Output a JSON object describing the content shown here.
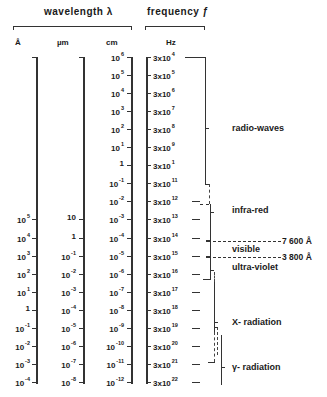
{
  "headers": {
    "wavelength": "wavelength λ",
    "frequency": "frequency ƒ"
  },
  "units": {
    "angstrom": "Å",
    "micrometer": "µm",
    "centimeter": "cm",
    "hertz": "Hz"
  },
  "rows": [
    {
      "ang": "",
      "um": "",
      "cm": [
        "10",
        "6"
      ],
      "hz": [
        "3x10",
        "4"
      ]
    },
    {
      "ang": "",
      "um": "",
      "cm": [
        "10",
        "5"
      ],
      "hz": [
        "3x10",
        "5"
      ]
    },
    {
      "ang": "",
      "um": "",
      "cm": [
        "10",
        "4"
      ],
      "hz": [
        "3x10",
        "6"
      ]
    },
    {
      "ang": "",
      "um": "",
      "cm": [
        "10",
        "3"
      ],
      "hz": [
        "3x10",
        "7"
      ]
    },
    {
      "ang": "",
      "um": "",
      "cm": [
        "10",
        "2"
      ],
      "hz": [
        "3x10",
        "8"
      ]
    },
    {
      "ang": "",
      "um": "",
      "cm": [
        "10",
        "1"
      ],
      "hz": [
        "3x10",
        "9"
      ]
    },
    {
      "ang": "",
      "um": "",
      "cm": [
        "1",
        ""
      ],
      "hz": [
        "3x10",
        "1"
      ]
    },
    {
      "ang": "",
      "um": "",
      "cm": [
        "10",
        "-1"
      ],
      "hz": [
        "3x10",
        "11"
      ]
    },
    {
      "ang": "",
      "um": "",
      "cm": [
        "10",
        "-2"
      ],
      "hz": [
        "3x10",
        "12"
      ]
    },
    {
      "ang": [
        "10",
        "5"
      ],
      "um": [
        "10",
        ""
      ],
      "cm": [
        "10",
        "-3"
      ],
      "hz": [
        "3x10",
        "13"
      ]
    },
    {
      "ang": [
        "10",
        "4"
      ],
      "um": [
        "1",
        ""
      ],
      "cm": [
        "10",
        "-4"
      ],
      "hz": [
        "3x10",
        "14"
      ]
    },
    {
      "ang": [
        "10",
        "3"
      ],
      "um": [
        "10",
        "-1"
      ],
      "cm": [
        "10",
        "-5"
      ],
      "hz": [
        "3x10",
        "15"
      ]
    },
    {
      "ang": [
        "10",
        "2"
      ],
      "um": [
        "10",
        "-2"
      ],
      "cm": [
        "10",
        "-6"
      ],
      "hz": [
        "3x10",
        "16"
      ]
    },
    {
      "ang": [
        "10",
        "1"
      ],
      "um": [
        "10",
        "-3"
      ],
      "cm": [
        "10",
        "-7"
      ],
      "hz": [
        "3x10",
        "17"
      ]
    },
    {
      "ang": [
        "1",
        ""
      ],
      "um": [
        "10",
        "-4"
      ],
      "cm": [
        "10",
        "-8"
      ],
      "hz": [
        "3x10",
        "18"
      ]
    },
    {
      "ang": [
        "10",
        "-1"
      ],
      "um": [
        "10",
        "-5"
      ],
      "cm": [
        "10",
        "-9"
      ],
      "hz": [
        "3x10",
        "19"
      ]
    },
    {
      "ang": [
        "10",
        "-2"
      ],
      "um": [
        "10",
        "-6"
      ],
      "cm": [
        "10",
        "-10"
      ],
      "hz": [
        "3x10",
        "20"
      ]
    },
    {
      "ang": [
        "10",
        "-3"
      ],
      "um": [
        "10",
        "-7"
      ],
      "cm": [
        "10",
        "-11"
      ],
      "hz": [
        "3x10",
        "21"
      ]
    },
    {
      "ang": [
        "10",
        "-4"
      ],
      "um": [
        "10",
        "-8"
      ],
      "cm": [
        "10",
        "-12"
      ],
      "hz": [
        "3x10",
        "22"
      ]
    }
  ],
  "regions": {
    "radio": "radio-waves",
    "infrared": "infra-red",
    "visible": "visible",
    "ultraviolet": "ultra-violet",
    "xray": "X- radiation",
    "gamma": "γ- radiation"
  },
  "annotations": {
    "red_limit": "7 600 Å",
    "violet_limit": "3 800 Å"
  }
}
